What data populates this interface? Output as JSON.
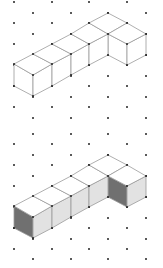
{
  "figure": {
    "width": 163,
    "height": 268,
    "background": "#ffffff",
    "grid": {
      "columns_x": [
        14,
        33,
        52,
        71,
        89,
        108,
        127,
        146
      ],
      "row_spacing": 21,
      "dot_radius": 1,
      "dot_color": "#222222"
    },
    "panels": [
      {
        "name": "wireframe",
        "y_offset": 0,
        "grid_even_col_y": [
          2,
          23,
          44,
          65,
          86,
          107
        ],
        "grid_odd_col_y": [
          13,
          34,
          55,
          76,
          97,
          118
        ],
        "shaded": false
      },
      {
        "name": "shaded",
        "y_offset": 142,
        "grid_even_col_y": [
          144,
          165,
          186,
          207,
          228,
          249
        ],
        "grid_odd_col_y": [
          134,
          155,
          176,
          197,
          218,
          239,
          259
        ],
        "shaded": true
      }
    ],
    "colors": {
      "edge": "#9a9a9a",
      "top_face": "#ffffff",
      "left_face": "#707070",
      "right_face": "#e2e2e2",
      "wire_face": "#ffffff"
    },
    "shape": {
      "description": "Row of 5 cubes along the up-right isometric axis with a 6th cube attached in front-right of the last cube (L-shape)",
      "top_faces": [
        [
          [
            14,
            64
          ],
          [
            33,
            54
          ],
          [
            52,
            64
          ],
          [
            33,
            75
          ]
        ],
        [
          [
            33,
            54
          ],
          [
            52,
            44
          ],
          [
            71,
            54
          ],
          [
            52,
            64
          ]
        ],
        [
          [
            52,
            44
          ],
          [
            71,
            34
          ],
          [
            89,
            44
          ],
          [
            71,
            54
          ]
        ],
        [
          [
            71,
            34
          ],
          [
            89,
            23
          ],
          [
            108,
            34
          ],
          [
            89,
            44
          ]
        ],
        [
          [
            89,
            23
          ],
          [
            108,
            13
          ],
          [
            127,
            23
          ],
          [
            108,
            34
          ]
        ],
        [
          [
            108,
            34
          ],
          [
            127,
            23
          ],
          [
            146,
            34
          ],
          [
            127,
            44
          ]
        ]
      ],
      "left_faces": [
        [
          [
            14,
            64
          ],
          [
            33,
            75
          ],
          [
            33,
            96
          ],
          [
            14,
            86
          ]
        ],
        [
          [
            108,
            34
          ],
          [
            127,
            44
          ],
          [
            127,
            65
          ],
          [
            108,
            55
          ]
        ]
      ],
      "right_faces": [
        [
          [
            33,
            75
          ],
          [
            52,
            64
          ],
          [
            52,
            86
          ],
          [
            33,
            96
          ]
        ],
        [
          [
            52,
            64
          ],
          [
            71,
            54
          ],
          [
            71,
            75
          ],
          [
            52,
            86
          ]
        ],
        [
          [
            71,
            54
          ],
          [
            89,
            44
          ],
          [
            89,
            65
          ],
          [
            71,
            75
          ]
        ],
        [
          [
            89,
            44
          ],
          [
            108,
            34
          ],
          [
            108,
            55
          ],
          [
            89,
            65
          ]
        ],
        [
          [
            127,
            44
          ],
          [
            146,
            34
          ],
          [
            146,
            55
          ],
          [
            127,
            65
          ]
        ]
      ],
      "vertices": [
        [
          14,
          64
        ],
        [
          33,
          54
        ],
        [
          52,
          44
        ],
        [
          71,
          34
        ],
        [
          89,
          23
        ],
        [
          108,
          13
        ],
        [
          127,
          23
        ],
        [
          146,
          34
        ],
        [
          33,
          75
        ],
        [
          52,
          64
        ],
        [
          71,
          54
        ],
        [
          89,
          44
        ],
        [
          108,
          34
        ],
        [
          127,
          44
        ],
        [
          14,
          86
        ],
        [
          33,
          96
        ],
        [
          52,
          86
        ],
        [
          71,
          75
        ],
        [
          89,
          65
        ],
        [
          108,
          55
        ],
        [
          127,
          65
        ],
        [
          146,
          55
        ]
      ]
    }
  }
}
